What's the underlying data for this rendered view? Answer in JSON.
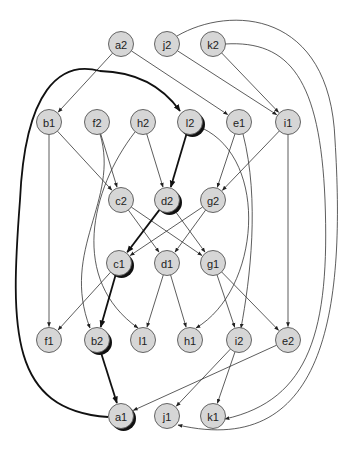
{
  "diagram": {
    "type": "directed-graph",
    "node_radius": 12.5,
    "colors": {
      "node_fill": "#d6d6d6",
      "node_stroke": "#555555",
      "edge": "#333333",
      "highlight_edge": "#111111",
      "shadow": "#111111",
      "background": "#ffffff"
    },
    "nodes": [
      {
        "id": "a2",
        "label": "a2",
        "x": 121,
        "y": 44
      },
      {
        "id": "j2",
        "label": "j2",
        "x": 167,
        "y": 44
      },
      {
        "id": "k2",
        "label": "k2",
        "x": 213,
        "y": 44
      },
      {
        "id": "b1",
        "label": "b1",
        "x": 49,
        "y": 122
      },
      {
        "id": "f2",
        "label": "f2",
        "x": 97,
        "y": 122
      },
      {
        "id": "h2",
        "label": "h2",
        "x": 143,
        "y": 122
      },
      {
        "id": "l2",
        "label": "l2",
        "x": 190,
        "y": 122,
        "highlighted": true
      },
      {
        "id": "e1",
        "label": "e1",
        "x": 239,
        "y": 122
      },
      {
        "id": "i1",
        "label": "i1",
        "x": 288,
        "y": 122
      },
      {
        "id": "c2",
        "label": "c2",
        "x": 121,
        "y": 200
      },
      {
        "id": "d2",
        "label": "d2",
        "x": 167,
        "y": 200,
        "highlighted": true
      },
      {
        "id": "g2",
        "label": "g2",
        "x": 213,
        "y": 200
      },
      {
        "id": "c1",
        "label": "c1",
        "x": 119,
        "y": 263,
        "highlighted": true
      },
      {
        "id": "d1",
        "label": "d1",
        "x": 167,
        "y": 263
      },
      {
        "id": "g1",
        "label": "g1",
        "x": 213,
        "y": 263
      },
      {
        "id": "f1",
        "label": "f1",
        "x": 49,
        "y": 340
      },
      {
        "id": "b2",
        "label": "b2",
        "x": 97,
        "y": 340,
        "highlighted": true
      },
      {
        "id": "l1",
        "label": "l1",
        "x": 143,
        "y": 340
      },
      {
        "id": "h1",
        "label": "h1",
        "x": 190,
        "y": 340
      },
      {
        "id": "i2",
        "label": "i2",
        "x": 239,
        "y": 340
      },
      {
        "id": "e2",
        "label": "e2",
        "x": 288,
        "y": 340
      },
      {
        "id": "a1",
        "label": "a1",
        "x": 121,
        "y": 416,
        "highlighted": true
      },
      {
        "id": "j1",
        "label": "j1",
        "x": 167,
        "y": 416
      },
      {
        "id": "k1",
        "label": "k1",
        "x": 213,
        "y": 416
      }
    ],
    "edges": [
      {
        "from": "a2",
        "to": "b1"
      },
      {
        "from": "a2",
        "to": "e1"
      },
      {
        "from": "j2",
        "to": "i1"
      },
      {
        "from": "k2",
        "to": "i1"
      },
      {
        "from": "j2",
        "to": "j1",
        "curve": "M 177 36 C 230 5, 330 10, 335 140 C 345 300, 330 460, 178 425"
      },
      {
        "from": "k2",
        "to": "k1",
        "curve": "M 225 44 C 290 40, 320 80, 325 200 C 330 330, 310 400, 225 419"
      },
      {
        "from": "a1",
        "to": "l2",
        "bold": true,
        "curve": "M 108 417 C 10 410, 10 330, 20 200 C 25 90, 60 60, 100 71 C 140 72, 165 90, 180 111"
      },
      {
        "from": "b1",
        "to": "c2"
      },
      {
        "from": "b1",
        "to": "f1"
      },
      {
        "from": "f2",
        "to": "c2"
      },
      {
        "from": "f2",
        "to": "b2",
        "curve": "M 100 134 C 120 200, 60 250, 90 328"
      },
      {
        "from": "h2",
        "to": "d2"
      },
      {
        "from": "h2",
        "to": "l1",
        "curve": "M 135 132 C 90 190, 70 280, 138 328"
      },
      {
        "from": "l2",
        "to": "d2",
        "bold": true
      },
      {
        "from": "l2",
        "to": "h1",
        "curve": "M 202 128 C 270 160, 260 290, 196 328"
      },
      {
        "from": "e1",
        "to": "g2"
      },
      {
        "from": "e1",
        "to": "i2",
        "curve": "M 243 134 C 260 200, 250 280, 241 328"
      },
      {
        "from": "i1",
        "to": "g2"
      },
      {
        "from": "i1",
        "to": "e2"
      },
      {
        "from": "c2",
        "to": "d1"
      },
      {
        "from": "c2",
        "to": "g1"
      },
      {
        "from": "d2",
        "to": "c1",
        "bold": true
      },
      {
        "from": "d2",
        "to": "g1"
      },
      {
        "from": "g2",
        "to": "c1"
      },
      {
        "from": "g2",
        "to": "d1"
      },
      {
        "from": "c1",
        "to": "f1"
      },
      {
        "from": "c1",
        "to": "b2",
        "bold": true
      },
      {
        "from": "d1",
        "to": "l1"
      },
      {
        "from": "d1",
        "to": "h1"
      },
      {
        "from": "g1",
        "to": "i2"
      },
      {
        "from": "g1",
        "to": "e2"
      },
      {
        "from": "b2",
        "to": "a1",
        "bold": true
      },
      {
        "from": "e2",
        "to": "a1"
      },
      {
        "from": "i2",
        "to": "j1"
      },
      {
        "from": "i2",
        "to": "k1"
      }
    ]
  }
}
